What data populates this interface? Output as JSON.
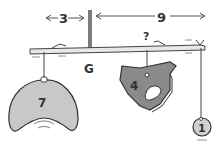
{
  "diagram": {
    "dimensions": {
      "left_distance": "3",
      "right_distance": "9"
    },
    "pivot_label": "G",
    "unknown_label": "?",
    "weights": [
      {
        "label": "7",
        "shape": "crescent",
        "color": "#c8c8c8"
      },
      {
        "label": "4",
        "shape": "blob-with-hole",
        "color": "#8a8a8a"
      },
      {
        "label": "1",
        "shape": "circle",
        "color": "#d0d0d0"
      }
    ],
    "colors": {
      "ink": "#333333",
      "light_gray": "#c8c8c8",
      "dark_gray": "#8a8a8a"
    }
  }
}
